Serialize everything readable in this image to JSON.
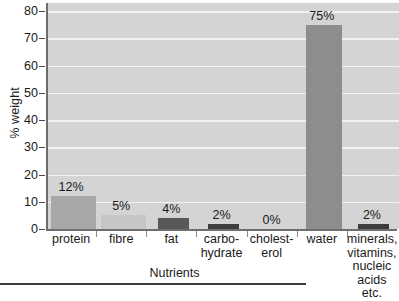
{
  "chart_data": {
    "type": "bar",
    "title": "",
    "xlabel": "Nutrients",
    "ylabel": "% weight",
    "ylim": [
      0,
      80
    ],
    "ytick_step": 10,
    "yticks": [
      80,
      70,
      60,
      50,
      40,
      30,
      20,
      10,
      0
    ],
    "grid": true,
    "legend": "none",
    "categories": [
      "protein",
      "fibre",
      "fat",
      "carbo-\nhydrate",
      "cholest-\nerol",
      "water",
      "minerals,\nvitamins,\nnucleic\nacids etc."
    ],
    "values": [
      12,
      5,
      4,
      2,
      0,
      75,
      2
    ],
    "value_labels": [
      "12%",
      "5%",
      "4%",
      "2%",
      "0%",
      "75%",
      "2%"
    ],
    "bar_colors": [
      "#a8a8a8",
      "#c6c6c6",
      "#585858",
      "#3d3d3d",
      "#d4d4d4",
      "#8d8d8d",
      "#3d3d3d"
    ]
  },
  "axes": {
    "y_title": "% weight",
    "x_title": "Nutrients",
    "y_tick_labels": [
      "80",
      "70",
      "60",
      "50",
      "40",
      "30",
      "20",
      "10",
      "0"
    ]
  },
  "categories": [
    {
      "label_lines": [
        "protein"
      ],
      "value_label": "12%"
    },
    {
      "label_lines": [
        "fibre"
      ],
      "value_label": "5%"
    },
    {
      "label_lines": [
        "fat"
      ],
      "value_label": "4%"
    },
    {
      "label_lines": [
        "carbo-",
        "hydrate"
      ],
      "value_label": "2%"
    },
    {
      "label_lines": [
        "cholest-",
        "erol"
      ],
      "value_label": "0%"
    },
    {
      "label_lines": [
        "water"
      ],
      "value_label": "75%"
    },
    {
      "label_lines": [
        "minerals,",
        "vitamins,",
        "nucleic",
        "acids etc."
      ],
      "value_label": "2%"
    }
  ],
  "colors": {
    "plot_background": "#d4d4d4",
    "gridline": "#f2f2f2",
    "axis": "#6e6e6e",
    "text": "#1a1a1a",
    "rule": "#3c3c3c"
  }
}
